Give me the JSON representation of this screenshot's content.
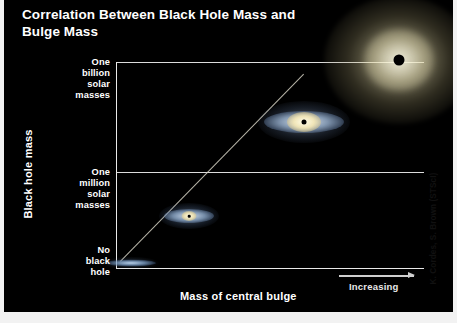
{
  "title": "Correlation Between Black Hole Mass and Bulge Mass",
  "axes": {
    "y_title": "Black hole mass",
    "x_title": "Mass of central bulge",
    "x_direction_label": "Increasing",
    "y_ticks": [
      {
        "label": "One\nbillion\nsolar\nmasses",
        "value": "1e9"
      },
      {
        "label": "One\nmillion\nsolar\nmasses",
        "value": "1e6"
      },
      {
        "label": "No\nblack\nhole",
        "value": "0"
      }
    ]
  },
  "credit": "K. Cordes, S. Brown (STScI)",
  "colors": {
    "background": "#000000",
    "axis": "#e9e9e9",
    "grid": "#dcdcdc",
    "text": "#ffffff",
    "trend_line": "#d6d2c4",
    "bulge": "#f6e8b4",
    "disk": "#a5c0e0",
    "black_hole": "#000000",
    "frame": "#f2f2f2"
  },
  "chart_data": {
    "type": "scatter",
    "title": "Correlation Between Black Hole Mass and Bulge Mass",
    "xlabel": "Mass of central bulge",
    "ylabel": "Black hole mass",
    "xticklabels": [
      "Increasing"
    ],
    "yticklabels": [
      "No black hole",
      "One million solar masses",
      "One billion solar masses"
    ],
    "grid": true,
    "legend": false,
    "trend": "linear increasing correlation",
    "points": [
      {
        "name": "dwarf-disk-galaxy",
        "x": 0.05,
        "y": 0.0,
        "black_hole_mass": "No black hole",
        "galaxy_type": "flat blue disk"
      },
      {
        "name": "small-spiral-galaxy",
        "x": 0.24,
        "y": 0.25,
        "black_hole_mass": "below one million solar masses",
        "galaxy_type": "small spiral with faint bulge"
      },
      {
        "name": "medium-spiral-galaxy",
        "x": 0.61,
        "y": 0.71,
        "black_hole_mass": "between one million and one billion solar masses",
        "galaxy_type": "spiral with prominent bulge"
      },
      {
        "name": "giant-elliptical-galaxy",
        "x": 0.92,
        "y": 1.0,
        "black_hole_mass": "one billion solar masses",
        "galaxy_type": "giant elliptical"
      }
    ]
  }
}
